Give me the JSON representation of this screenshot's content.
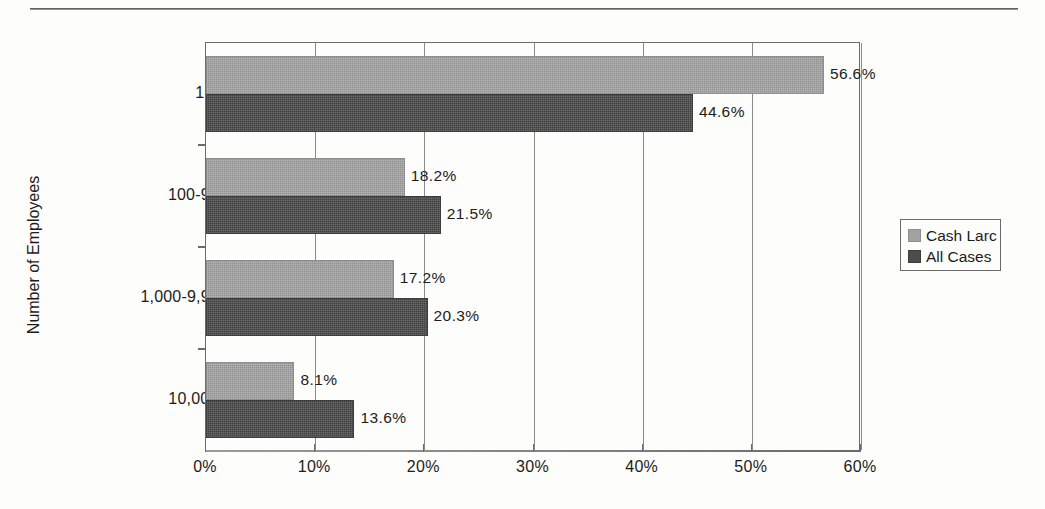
{
  "chart_data": {
    "type": "bar",
    "orientation": "horizontal",
    "title": "",
    "xlabel": "",
    "ylabel": "Number of Employees",
    "categories": [
      "1-99",
      "100-999",
      "1,000-9,999",
      "10,000+"
    ],
    "series": [
      {
        "name": "Cash Larc",
        "color": "#a2a2a2",
        "values": [
          56.6,
          18.2,
          17.2,
          8.1
        ],
        "labels": [
          "56.6%",
          "18.2%",
          "17.2%",
          "8.1%"
        ]
      },
      {
        "name": "All Cases",
        "color": "#4d4d4d",
        "values": [
          44.6,
          21.5,
          20.3,
          13.6
        ],
        "labels": [
          "44.6%",
          "21.5%",
          "20.3%",
          "13.6%"
        ]
      }
    ],
    "xlim": [
      0,
      60
    ],
    "xticks": [
      0,
      10,
      20,
      30,
      40,
      50,
      60
    ],
    "xtick_labels": [
      "0%",
      "10%",
      "20%",
      "30%",
      "40%",
      "50%",
      "60%"
    ],
    "grid": "vertical",
    "legend_position": "right"
  },
  "legend": {
    "entries": [
      {
        "label": "Cash Larc"
      },
      {
        "label": "All Cases"
      }
    ]
  }
}
